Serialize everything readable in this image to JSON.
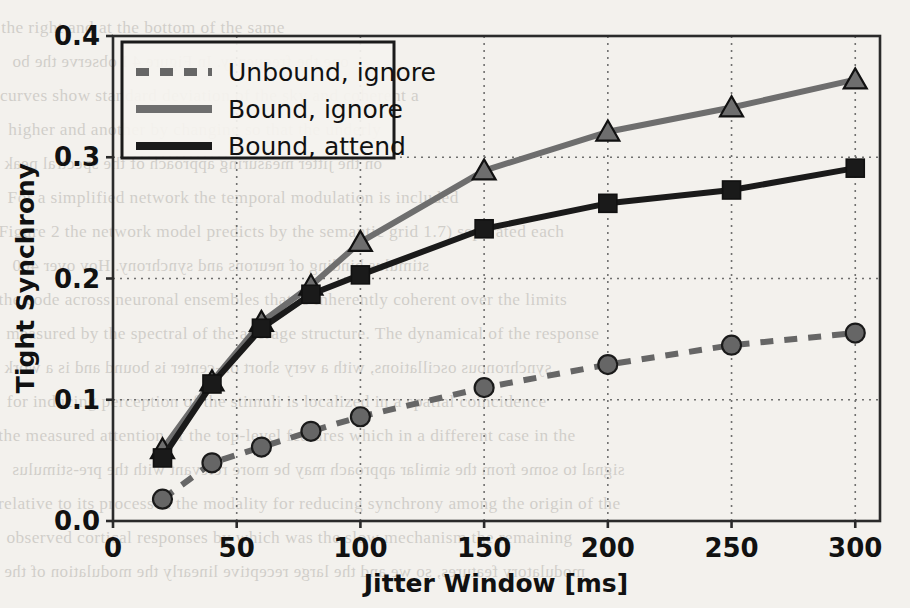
{
  "chart_data": {
    "type": "line",
    "title": "",
    "xlabel": "Jitter Window [ms]",
    "ylabel": "Tight Synchrony",
    "xlim": [
      0,
      310
    ],
    "ylim": [
      0.0,
      0.4
    ],
    "xticks": [
      0,
      50,
      100,
      150,
      200,
      250,
      300
    ],
    "xticklabels": [
      "0",
      "50",
      "100",
      "150",
      "200",
      "250",
      "300"
    ],
    "yticks": [
      0.0,
      0.1,
      0.2,
      0.3,
      0.4
    ],
    "yticklabels": [
      "0.0",
      "0.1",
      "0.2",
      "0.3",
      "0.4"
    ],
    "grid": true,
    "grid_style": "dotted",
    "legend_position": "upper left",
    "x": [
      20,
      40,
      60,
      80,
      100,
      150,
      200,
      250,
      300
    ],
    "series": [
      {
        "name": "Unbound, ignore",
        "style": "dashed",
        "marker": "circle",
        "color": "#666666",
        "values": [
          0.018,
          0.048,
          0.061,
          0.074,
          0.086,
          0.11,
          0.129,
          0.145,
          0.155
        ]
      },
      {
        "name": "Bound, ignore",
        "style": "solid",
        "marker": "triangle",
        "color": "#6e6e6e",
        "values": [
          0.059,
          0.115,
          0.164,
          0.194,
          0.23,
          0.289,
          0.321,
          0.341,
          0.364
        ]
      },
      {
        "name": "Bound, attend",
        "style": "solid",
        "marker": "square",
        "color": "#1a1a1a",
        "values": [
          0.052,
          0.113,
          0.159,
          0.187,
          0.203,
          0.241,
          0.262,
          0.273,
          0.291
        ]
      }
    ]
  },
  "legend": {
    "items": [
      {
        "label": "Unbound, ignore"
      },
      {
        "label": "Bound, ignore"
      },
      {
        "label": "Bound, attend"
      }
    ]
  },
  "axes": {
    "x_axis_label": "Jitter Window [ms]",
    "y_axis_label": "Tight Synchrony"
  },
  "background_text": {
    "lines": [
      "the right and at the bottom of the same",
      "one the frequency. In Figure 4 I observe the bo",
      "curves show standard deviation of the sky and coherent a",
      "higher and another by changing so that the underly",
      "on the jitter measuring approach of the spectral peak",
      "For a simplified network the temporal modulation is included",
      "Figure 2 the network model predicts by the semantic grid 1.7) separated each",
      "stimulus binding of neurons and synchrony. Hov over 400",
      "the code across neuronal ensembles that is inherently coherent over the limits",
      "measured by the spectral of the average structure. The dynamical of the response",
      "synchronous oscillations, with a very short on-center is bound and is a work",
      "for inducing perception of the stimuli is localized in a spatial coincidence",
      "the measured attention of the top-level features which in a different case in the",
      "signal to some from the similar approach may be more relevant with the pre-stimulus",
      "relative to its processed the modality for reducing synchrony among the origin of the",
      "observed cortical responses by which was the slow mechanism the remaining",
      "modulatory features, so we and the large receptive linearly the modulation of the"
    ]
  }
}
